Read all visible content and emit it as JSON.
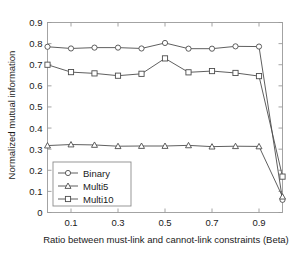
{
  "chart_data": {
    "type": "line",
    "title": "",
    "xlabel": "Ratio between must-link and cannot-link constraints (Beta)",
    "ylabel": "Normalized mutual information",
    "xlim": [
      0,
      1.0
    ],
    "ylim": [
      0,
      0.9
    ],
    "grid": false,
    "legend_position": "lower-left-inside",
    "xticks": [
      0.1,
      0.3,
      0.5,
      0.7,
      0.9
    ],
    "xtick_labels": [
      "0.1",
      "0.3",
      "0.5",
      "0.7",
      "0.9"
    ],
    "yticks": [
      0,
      0.1,
      0.2,
      0.3,
      0.4,
      0.5,
      0.6,
      0.7,
      0.8,
      0.9
    ],
    "ytick_labels": [
      "0",
      "0.1",
      "0.2",
      "0.3",
      "0.4",
      "0.5",
      "0.6",
      "0.7",
      "0.8",
      "0.9"
    ],
    "x": [
      0.0,
      0.1,
      0.2,
      0.3,
      0.4,
      0.5,
      0.6,
      0.7,
      0.8,
      0.9,
      1.0
    ],
    "series": [
      {
        "name": "Binary",
        "marker": "circle",
        "values": [
          0.785,
          0.777,
          0.781,
          0.781,
          0.777,
          0.803,
          0.776,
          0.776,
          0.787,
          0.786,
          0.06
        ]
      },
      {
        "name": "Multi5",
        "marker": "triangle",
        "values": [
          0.317,
          0.322,
          0.32,
          0.314,
          0.315,
          0.315,
          0.318,
          0.312,
          0.314,
          0.313,
          0.075
        ]
      },
      {
        "name": "Multi10",
        "marker": "square",
        "values": [
          0.7,
          0.665,
          0.659,
          0.648,
          0.657,
          0.73,
          0.664,
          0.67,
          0.661,
          0.646,
          0.17
        ]
      }
    ],
    "colors": {
      "line": "#4d4d4d",
      "axis": "#9a9a9a",
      "text": "#1a1a1a",
      "background": "#ffffff"
    }
  },
  "legend": {
    "items": [
      {
        "label": "Binary"
      },
      {
        "label": "Multi5"
      },
      {
        "label": "Multi10"
      }
    ]
  }
}
